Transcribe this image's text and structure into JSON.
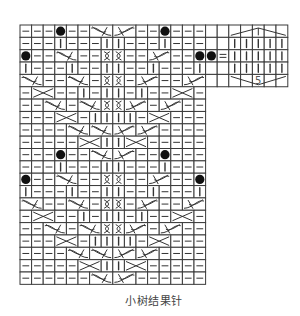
{
  "caption": "小树结果针",
  "colors": {
    "line": "#3a3a3a",
    "symbol": "#333333",
    "background": "#ffffff"
  },
  "main_chart": {
    "columns": 16,
    "rows": 21,
    "legend": {
      "tokens": {
        "-": "purl-dash",
        "|": "knit-bar",
        "o": "bobble-dot",
        "x": "twisted-stitch",
        "LC": "left-cable-2st",
        "RC": "right-cable-2st",
        "C": "cross-2st",
        "": "empty",
        "=": "equals"
      }
    },
    "grid": [
      [
        "-",
        "-",
        "-",
        "o",
        "-",
        "-",
        "LC",
        "RC",
        "-",
        "-",
        "o",
        "-",
        "-",
        "-"
      ],
      [
        "-",
        "-",
        "-",
        "|",
        "-",
        "-",
        "-",
        "|",
        "|",
        "-",
        "-",
        "-",
        "|",
        "-",
        "-",
        "-"
      ],
      [
        "o",
        "-",
        "-",
        "LC",
        "-",
        "-",
        "x",
        "x",
        "-",
        "-",
        "RC",
        "-",
        "-",
        "o"
      ],
      [
        "|",
        "-",
        "-",
        "-",
        "|",
        "-",
        "-",
        "|",
        "|",
        "-",
        "-",
        "|",
        "-",
        "-",
        "-",
        "|"
      ],
      [
        "LC",
        "-",
        "-",
        "LC",
        "-",
        "x",
        "x",
        "-",
        "RC",
        "-",
        "-",
        "RC"
      ],
      [
        "-",
        "C",
        "-",
        "-",
        "|",
        "-",
        "|",
        "|",
        "-",
        "|",
        "-",
        "-",
        "C",
        "-"
      ],
      [
        "-",
        "-",
        "LC",
        "-",
        "LC",
        "x",
        "x",
        "RC",
        "-",
        "RC",
        "-",
        "-"
      ],
      [
        "-",
        "-",
        "-",
        "C",
        "-",
        "|",
        "|",
        "|",
        "|",
        "-",
        "C",
        "-",
        "-",
        "-"
      ],
      [
        "-",
        "-",
        "-",
        "-",
        "LC",
        "LC",
        "RC",
        "RC",
        "-",
        "-",
        "-",
        "-"
      ],
      [
        "-",
        "-",
        "-",
        "-",
        "-",
        "C",
        "|",
        "|",
        "C",
        "-",
        "-",
        "-",
        "-",
        "-"
      ],
      [
        "-",
        "-",
        "-",
        "o",
        "-",
        "-",
        "LC",
        "RC",
        "-",
        "-",
        "o",
        "-",
        "-",
        "-"
      ],
      [
        "-",
        "-",
        "-",
        "|",
        "-",
        "-",
        "-",
        "|",
        "|",
        "-",
        "-",
        "-",
        "|",
        "-",
        "-",
        "-"
      ],
      [
        "o",
        "-",
        "-",
        "LC",
        "-",
        "-",
        "x",
        "x",
        "-",
        "-",
        "RC",
        "-",
        "-",
        "o"
      ],
      [
        "|",
        "-",
        "-",
        "-",
        "|",
        "-",
        "-",
        "|",
        "|",
        "-",
        "-",
        "|",
        "-",
        "-",
        "-",
        "|"
      ],
      [
        "LC",
        "-",
        "-",
        "LC",
        "-",
        "x",
        "x",
        "-",
        "RC",
        "-",
        "-",
        "RC"
      ],
      [
        "-",
        "C",
        "-",
        "-",
        "|",
        "-",
        "|",
        "|",
        "-",
        "|",
        "-",
        "-",
        "C",
        "-"
      ],
      [
        "-",
        "-",
        "LC",
        "-",
        "LC",
        "x",
        "x",
        "RC",
        "-",
        "RC",
        "-",
        "-"
      ],
      [
        "-",
        "-",
        "-",
        "C",
        "-",
        "|",
        "|",
        "|",
        "|",
        "-",
        "C",
        "-",
        "-",
        "-"
      ],
      [
        "-",
        "-",
        "-",
        "-",
        "LC",
        "LC",
        "RC",
        "RC",
        "-",
        "-",
        "-",
        "-"
      ],
      [
        "-",
        "-",
        "-",
        "-",
        "-",
        "C",
        "|",
        "|",
        "C",
        "-",
        "-",
        "-",
        "-",
        "-"
      ],
      [
        "-",
        "-",
        "-",
        "-",
        "-",
        "-",
        "LC",
        "RC",
        "-",
        "-",
        "-",
        "-",
        "-",
        "-"
      ]
    ],
    "extension": [
      [
        "",
        ""
      ],
      [
        "",
        ""
      ],
      [
        "o",
        "="
      ],
      [
        "",
        ""
      ],
      [
        "",
        ""
      ]
    ]
  },
  "legend_box": {
    "columns": 5,
    "rows": 5,
    "label": "5",
    "symbol": "5-stitch diamond bobble (5 knit stitches increased and decreased)"
  }
}
